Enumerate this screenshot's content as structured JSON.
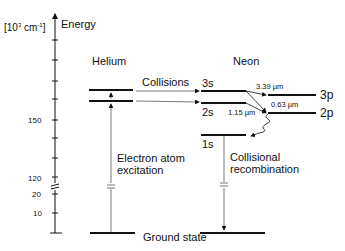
{
  "axis": {
    "unit_prefix": "[10",
    "unit_sup": "3",
    "unit_mid": " cm",
    "unit_sup2": "-1",
    "unit_suffix": "]",
    "title": "Energy",
    "tick_labels": {
      "t150": "150",
      "t120": "120",
      "t20": "20",
      "t10": "10"
    }
  },
  "helium": {
    "title": "Helium",
    "excitation_label_1": "Electron atom",
    "excitation_label_2": "excitation"
  },
  "neon": {
    "title": "Neon",
    "levels": {
      "s3": "3s",
      "s2": "2s",
      "p3": "3p",
      "p2": "2p",
      "s1": "1s"
    },
    "transitions": {
      "t339": "3.39 µm",
      "t063": "0.63 µm",
      "t115": "1.15 µm"
    },
    "recombination_label_1": "Collisional",
    "recombination_label_2": "recombination"
  },
  "collisions_label": "Collisions",
  "ground_state_label": "Ground state"
}
